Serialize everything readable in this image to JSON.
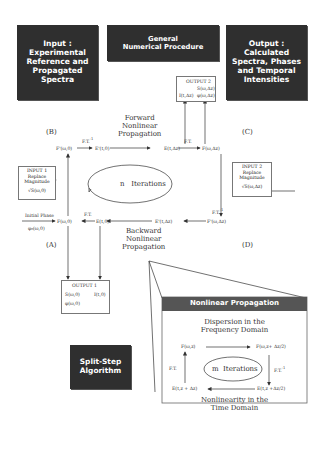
{
  "header_boxes": {
    "input": {
      "lines": [
        "Input :",
        "Experimental",
        "Reference and",
        "Propagated",
        "Spectra"
      ]
    },
    "procedure": {
      "lines": [
        "General",
        "Numerical Procedure"
      ]
    },
    "output": {
      "lines": [
        "Output :",
        "Calculated",
        "Spectra, Phases",
        "and Temporal",
        "Intensities"
      ]
    }
  },
  "corner_labels": {
    "a": "(A)",
    "b": "(B)",
    "c": "(C)",
    "d": "(D)"
  },
  "nodes": {
    "f_prime_omega_0": "F'(ω,0)",
    "e_prime_t_0": "E'(t,0)",
    "e_t_dz": "E(t,Δz)",
    "f_omega_dz": "F(ω,Δz)",
    "f_prime_omega_dz": "F'(ω,Δz)",
    "e_prime_t_dz": "E'(t,Δz)",
    "e_t_0": "E(t,0)",
    "f_omega_0": "F(ω,0)"
  },
  "transforms": {
    "ift_top": "F.T.",
    "ift_top_sup": "-1",
    "ft_top": "F.T.",
    "ift_right": "F.T.",
    "ift_right_sup": "-1",
    "ft_bottom": "F.T."
  },
  "forward": {
    "lines": [
      "Forward",
      "Nonlinear",
      "Propagation"
    ]
  },
  "backward": {
    "lines": [
      "Backward",
      "Nonlinear",
      "Propagation"
    ]
  },
  "iterations_main": {
    "variable": "n",
    "label": "Iterations"
  },
  "initial_phase": {
    "label": "Initial Phase",
    "value": "φ₀(ω,0)"
  },
  "input1": {
    "title": "INPUT 1",
    "line1": "Replace",
    "line2": "Magnitude",
    "formula": "√S(ω,0)"
  },
  "input2": {
    "title": "INPUT 2",
    "line1": "Replace",
    "line2": "Magnitude",
    "formula": "√S(ω,Δz)"
  },
  "output1": {
    "title": "OUTPUT 1",
    "s": "S(ω,0)",
    "i": "I(t,0)",
    "phi": "φ(ω,0)"
  },
  "output2": {
    "title": "OUTPUT 2",
    "s": "S(ω,Δz)",
    "i": "I(t,Δz)",
    "phi": "φ(ω,Δz)"
  },
  "split_step": {
    "lines": [
      "Split-Step",
      "Algorithm"
    ]
  },
  "nonlinear_panel": {
    "title": "Nonlinear Propagation",
    "dispersion": [
      "Dispersion in the",
      "Frequency  Domain"
    ],
    "nonlinearity": [
      "Nonlinearity in the",
      "Time Domain"
    ],
    "node_tl": "F(ω,z)",
    "node_tr": "F(ω,z+ Δz/2)",
    "node_br": "E(t,z +Δz/2)",
    "node_bl": "E(t,z + Δz)",
    "ft_left": "F.T.",
    "ift_right": "F.T.",
    "ift_right_sup": "-1",
    "iterations": {
      "variable": "m",
      "label": "Iterations"
    }
  },
  "colors": {
    "dark_box": "#2f2f2f",
    "panel_header": "#555555",
    "line": "#333333"
  }
}
